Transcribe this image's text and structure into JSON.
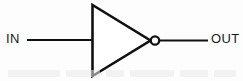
{
  "diagram": {
    "background_color": "#fdfdfd",
    "stroke_color": "#111111",
    "labels": {
      "input": "IN",
      "output": "OUT"
    },
    "symbol": {
      "type": "not-gate",
      "name": "inverter",
      "triangle": {
        "vertices": [
          [
            92,
            5
          ],
          [
            92,
            76
          ],
          [
            150,
            40
          ]
        ],
        "stroke_width": 2.6,
        "fill": "none"
      },
      "bubble": {
        "cx": 155,
        "cy": 40,
        "r": 4.2,
        "stroke_width": 2.2,
        "fill": "#ffffff"
      }
    },
    "wires": [
      {
        "name": "input-wire",
        "x1": 27,
        "y1": 40,
        "x2": 92,
        "y2": 40,
        "stroke_width": 2.2
      },
      {
        "name": "output-wire",
        "x1": 159,
        "y1": 40,
        "x2": 208,
        "y2": 40,
        "stroke_width": 2.2
      }
    ],
    "artifacts": [
      {
        "name": "scan-ghost-1",
        "left": 8,
        "top": 70,
        "width": 52
      },
      {
        "name": "scan-ghost-2",
        "left": 66,
        "top": 70,
        "width": 34
      },
      {
        "name": "scan-ghost-3",
        "left": 106,
        "top": 70,
        "width": 18
      },
      {
        "name": "scan-ghost-4",
        "left": 130,
        "top": 70,
        "width": 44
      },
      {
        "name": "scan-ghost-5",
        "left": 180,
        "top": 70,
        "width": 28
      },
      {
        "name": "scan-ghost-6",
        "left": 214,
        "top": 70,
        "width": 22
      }
    ]
  }
}
